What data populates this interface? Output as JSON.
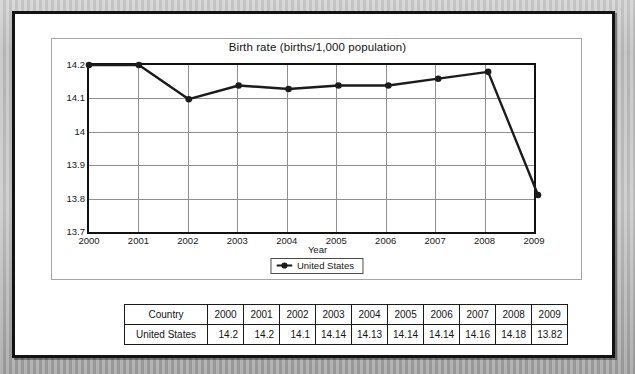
{
  "chart_data": {
    "type": "line",
    "title": "Birth rate (births/1,000 population)",
    "xlabel": "Year",
    "ylabel": "",
    "categories": [
      "2000",
      "2001",
      "2002",
      "2003",
      "2004",
      "2005",
      "2006",
      "2007",
      "2008",
      "2009"
    ],
    "series": [
      {
        "name": "United States",
        "values": [
          14.2,
          14.2,
          14.1,
          14.14,
          14.13,
          14.14,
          14.14,
          14.16,
          14.18,
          13.82
        ],
        "marker": "circle",
        "color": "#1b1b1b"
      }
    ],
    "ylim": [
      13.7,
      14.2
    ],
    "ytick_labels": [
      "14.2",
      "14.1",
      "14",
      "13.9",
      "13.8",
      "13.7"
    ],
    "ytick_values": [
      14.2,
      14.1,
      14.0,
      13.9,
      13.8,
      13.7
    ],
    "grid": "both",
    "legend_position": "bottom",
    "legend_entries": [
      "United States"
    ]
  },
  "table": {
    "header": [
      "Country",
      "2000",
      "2001",
      "2002",
      "2003",
      "2004",
      "2005",
      "2006",
      "2007",
      "2008",
      "2009"
    ],
    "rows": [
      [
        "United States",
        "14.2",
        "14.2",
        "14.1",
        "14.14",
        "14.13",
        "14.14",
        "14.14",
        "14.16",
        "14.18",
        "13.82"
      ]
    ]
  }
}
